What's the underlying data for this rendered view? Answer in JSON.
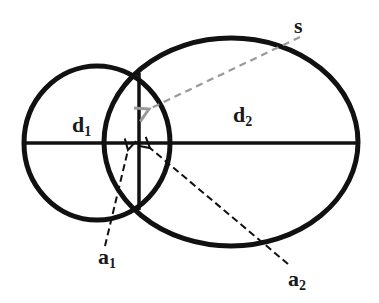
{
  "diagram": {
    "type": "overlapping-ellipses",
    "colors": {
      "stroke": "#111111",
      "dashed_black": "#111111",
      "dashed_gray": "#999999",
      "background": "#ffffff"
    },
    "ellipses": [
      {
        "id": "left",
        "cx": 97,
        "cy": 143,
        "rx": 73,
        "ry": 77
      },
      {
        "id": "right",
        "cx": 231,
        "cy": 142,
        "rx": 127,
        "ry": 104
      }
    ],
    "labels": {
      "s": {
        "base": "s",
        "sub": ""
      },
      "d1": {
        "base": "d",
        "sub": "1"
      },
      "d2": {
        "base": "d",
        "sub": "2"
      },
      "a1": {
        "base": "a",
        "sub": "1"
      },
      "a2": {
        "base": "a",
        "sub": "2"
      }
    }
  }
}
